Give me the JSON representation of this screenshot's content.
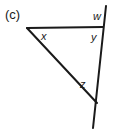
{
  "figure": {
    "part_label": "(c)",
    "background_color": "#ffffff",
    "stroke_color": "#1a1a1a",
    "width": 115,
    "height": 133,
    "angle_labels": [
      {
        "name": "w",
        "text": "w"
      },
      {
        "name": "x",
        "text": "x"
      },
      {
        "name": "y",
        "text": "y"
      },
      {
        "name": "z",
        "text": "z"
      }
    ],
    "lines": {
      "top_horizontal": {
        "x1": 27,
        "y1": 28,
        "x2": 103,
        "y2": 27
      },
      "diagonal": {
        "x1": 27,
        "y1": 28,
        "x2": 97,
        "y2": 103
      },
      "transversal": {
        "x1": 106,
        "y1": 6,
        "x2": 93,
        "y2": 128
      }
    }
  }
}
